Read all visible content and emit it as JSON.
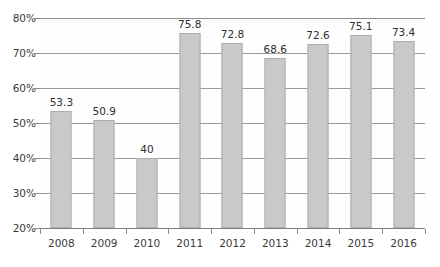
{
  "chart_data": {
    "type": "bar",
    "title": "",
    "xlabel": "",
    "ylabel": "",
    "categories": [
      "2008",
      "2009",
      "2010",
      "2011",
      "2012",
      "2013",
      "2014",
      "2015",
      "2016"
    ],
    "values": [
      53.3,
      50.9,
      40,
      75.8,
      72.8,
      68.6,
      72.6,
      75.1,
      73.4
    ],
    "data_labels": [
      "53.3",
      "50.9",
      "40",
      "75.8",
      "72.8",
      "68.6",
      "72.6",
      "75.1",
      "73.4"
    ],
    "ylim": [
      20,
      80
    ],
    "ytick_step": 10,
    "ytick_values": [
      20,
      30,
      40,
      50,
      60,
      70,
      80
    ],
    "ytick_labels": [
      "20%",
      "30%",
      "40%",
      "50%",
      "60%",
      "70%",
      "80%"
    ],
    "grid": true,
    "legend": null,
    "legend_position": "none",
    "colors": {
      "bar_fill": "#c9c9c9",
      "bar_border": "#adadad",
      "gridline": "#9a9a9a",
      "axis": "#8e8e8e",
      "text": "#3b3b3b",
      "plot_background": "#fdfdfd",
      "page_background": "#ffffff"
    }
  }
}
